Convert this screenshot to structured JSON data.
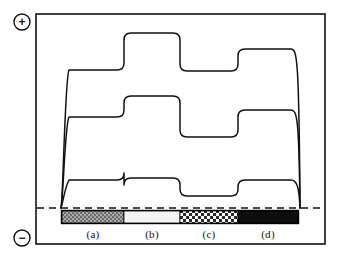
{
  "figure": {
    "kind": "stepped-trace-plot",
    "background": "#ffffff",
    "line_color": "#111111",
    "frame": {
      "x": 36,
      "y": 14,
      "width": 289,
      "height": 230,
      "stroke": "#111111",
      "stroke_width": 1.6
    },
    "polarity_markers": [
      {
        "name": "plus",
        "glyph": "+",
        "cx": 22,
        "cy": 22,
        "r": 8
      },
      {
        "name": "minus",
        "glyph": "−",
        "cx": 22,
        "cy": 238,
        "r": 8
      }
    ],
    "baseline": {
      "label": "origin baseline",
      "y": 208,
      "x1": 37,
      "x2": 324,
      "dash": "7,5",
      "stroke": "#111111",
      "stroke_width": 1.4
    }
  },
  "gel_bar": {
    "name": "lane-bar",
    "x": 62,
    "y": 211,
    "width": 236,
    "height": 12,
    "border": "#000000",
    "segments": [
      {
        "key": "a",
        "label": "(a)",
        "x": 62,
        "width": 62,
        "fill": "#9a9a9a",
        "pattern": "fine-checker-gray",
        "label_cx": 93
      },
      {
        "key": "b",
        "label": "(b)",
        "x": 124,
        "width": 56,
        "fill": "#f2f2f2",
        "pattern": "light-plain",
        "label_cx": 152
      },
      {
        "key": "c",
        "label": "(c)",
        "x": 180,
        "width": 58,
        "fill": "#ffffff",
        "pattern": "coarse-checker-dark",
        "label_cx": 209
      },
      {
        "key": "d",
        "label": "(d)",
        "x": 238,
        "width": 60,
        "fill": "#0d0d0d",
        "pattern": "solid-black",
        "label_cx": 268
      }
    ],
    "label_y": 228
  },
  "traces": {
    "count": 3,
    "rise_x": 62,
    "fall_x": 298,
    "region_boundaries": [
      124,
      180,
      238
    ],
    "series": [
      {
        "name": "trace-top",
        "levels_y": [
          70,
          33,
          71,
          49
        ],
        "comment": "upper trace: moderate in (a), highest in (b), drops in (c), rises again in (d)"
      },
      {
        "name": "trace-middle",
        "levels_y": [
          117,
          96,
          137,
          110
        ],
        "comment": "middle trace: steps across the four regions"
      },
      {
        "name": "trace-bottom",
        "levels_y": [
          180,
          178,
          196,
          180
        ],
        "comment": "lower trace: near baseline throughout with a dip in (c)"
      }
    ]
  }
}
